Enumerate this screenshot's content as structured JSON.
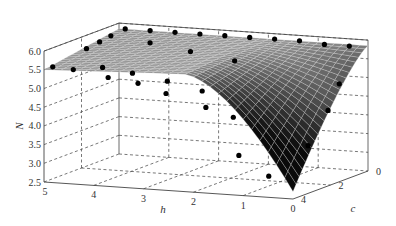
{
  "chart_data": {
    "type": "surface3d",
    "title": "",
    "axes": {
      "x": {
        "label": "h̄",
        "label_text": "h",
        "ticks": [
          5,
          4,
          3,
          2,
          1,
          0
        ],
        "range": [
          0,
          5
        ]
      },
      "y": {
        "label": "ĉ",
        "label_text": "c",
        "ticks": [
          4,
          2,
          0
        ],
        "range": [
          0,
          4
        ]
      },
      "z": {
        "label": "N",
        "ticks": [
          "2.5",
          "3.0",
          "3.5",
          "4.0",
          "4.5",
          "5.0",
          "5.5",
          "6.0"
        ],
        "range": [
          2.5,
          6.0
        ]
      }
    },
    "grid": true,
    "surface": {
      "description": "Plateau near N≈5.8 over most of the domain, dropping sharply to N≈2.8 at h=0, c=4",
      "plateau": 5.85,
      "min": 2.8,
      "grid_h": 30,
      "grid_c": 24
    },
    "points": [
      {
        "h": 4.8,
        "c": 0.2,
        "N": 5.9
      },
      {
        "h": 4.3,
        "c": 0.2,
        "N": 5.9
      },
      {
        "h": 3.8,
        "c": 0.2,
        "N": 5.9
      },
      {
        "h": 3.3,
        "c": 0.2,
        "N": 5.9
      },
      {
        "h": 2.8,
        "c": 0.2,
        "N": 5.9
      },
      {
        "h": 2.3,
        "c": 0.2,
        "N": 5.9
      },
      {
        "h": 1.8,
        "c": 0.2,
        "N": 5.9
      },
      {
        "h": 1.3,
        "c": 0.2,
        "N": 5.9
      },
      {
        "h": 0.8,
        "c": 0.2,
        "N": 5.85
      },
      {
        "h": 0.3,
        "c": 0.2,
        "N": 5.85
      },
      {
        "h": 4.9,
        "c": 0.7,
        "N": 5.8
      },
      {
        "h": 4.9,
        "c": 1.3,
        "N": 5.75
      },
      {
        "h": 4.9,
        "c": 2.0,
        "N": 5.7
      },
      {
        "h": 4.9,
        "c": 3.8,
        "N": 5.55
      },
      {
        "h": 4.6,
        "c": 3.5,
        "N": 5.45
      },
      {
        "h": 4.2,
        "c": 3.0,
        "N": 5.45
      },
      {
        "h": 3.9,
        "c": 3.5,
        "N": 5.3
      },
      {
        "h": 3.6,
        "c": 3.0,
        "N": 5.35
      },
      {
        "h": 3.3,
        "c": 3.5,
        "N": 5.2
      },
      {
        "h": 2.9,
        "c": 3.0,
        "N": 5.2
      },
      {
        "h": 2.7,
        "c": 3.6,
        "N": 5.0
      },
      {
        "h": 2.2,
        "c": 3.0,
        "N": 5.0
      },
      {
        "h": 1.9,
        "c": 3.6,
        "N": 4.7
      },
      {
        "h": 1.5,
        "c": 3.2,
        "N": 4.4
      },
      {
        "h": 1.2,
        "c": 3.7,
        "N": 3.5
      },
      {
        "h": 0.6,
        "c": 3.7,
        "N": 3.0
      },
      {
        "h": 0.3,
        "c": 2.4,
        "N": 3.6
      },
      {
        "h": 0.2,
        "c": 1.6,
        "N": 4.4
      },
      {
        "h": 0.2,
        "c": 1.0,
        "N": 5.0
      },
      {
        "h": 4.0,
        "c": 1.0,
        "N": 5.75
      },
      {
        "h": 3.0,
        "c": 1.5,
        "N": 5.7
      },
      {
        "h": 2.0,
        "c": 1.8,
        "N": 5.6
      }
    ]
  }
}
